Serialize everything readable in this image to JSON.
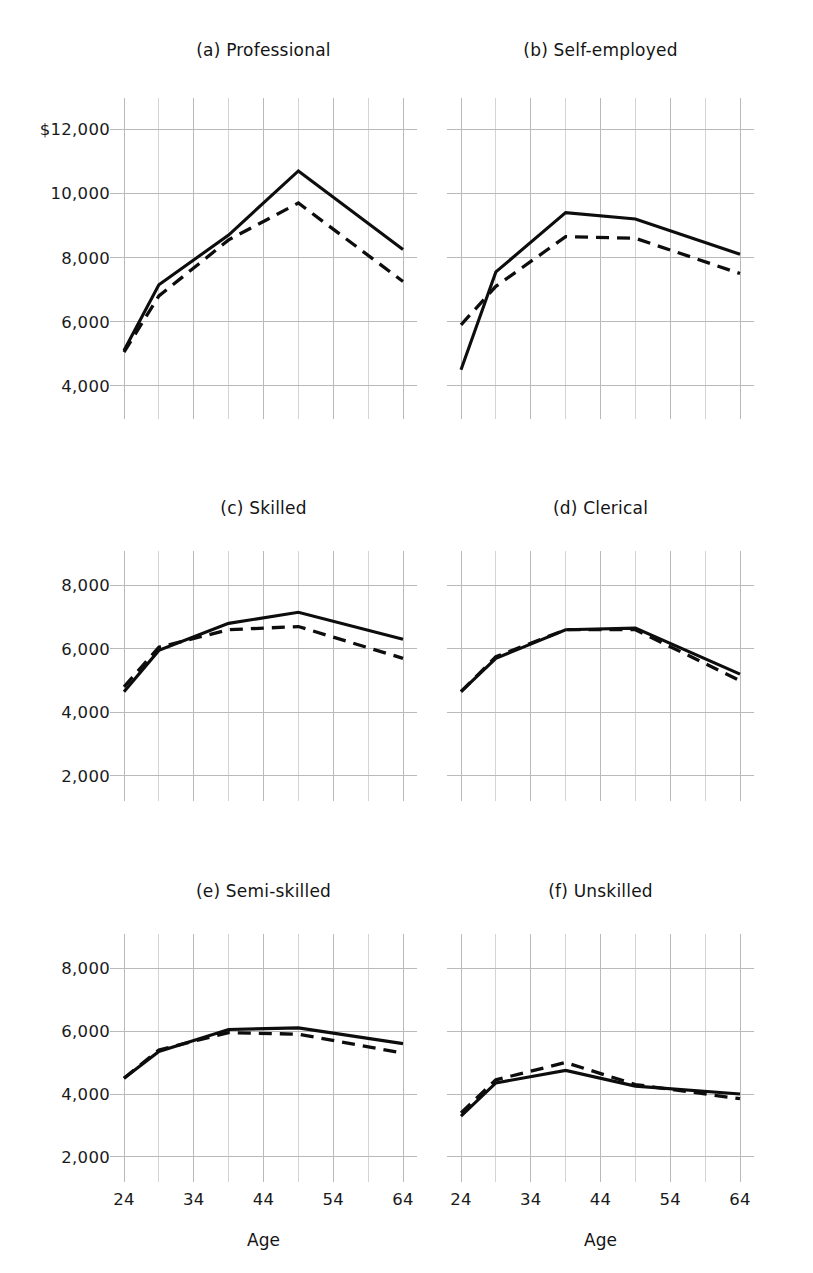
{
  "chart_data": {
    "type": "line",
    "title": "",
    "xlabel": "Age",
    "ylabel": "",
    "grid": true,
    "legend": "none",
    "x": [
      24,
      29,
      39,
      49,
      64
    ],
    "xlim": [
      24,
      64
    ],
    "x_ticklabels": [
      "24",
      "34",
      "44",
      "54",
      "64"
    ],
    "x_tickvalues": [
      24,
      34,
      44,
      54,
      64
    ],
    "x_gridlines": [
      24,
      29,
      34,
      39,
      44,
      49,
      54,
      59,
      64
    ],
    "series_names": [
      "solid",
      "dashed"
    ],
    "panels": [
      {
        "key": "a",
        "label": "(a)",
        "name": "Professional",
        "title": "(a)  Professional",
        "ylim": [
          3400,
          12600
        ],
        "y_ticklabels": [
          "$12,000",
          "10,000",
          "8,000",
          "6,000",
          "4,000"
        ],
        "y_tickvalues": [
          12000,
          10000,
          8000,
          6000,
          4000
        ],
        "series": [
          {
            "name": "solid",
            "values": [
              5100,
              7150,
              8700,
              10700,
              8250
            ]
          },
          {
            "name": "dashed",
            "values": [
              5050,
              6800,
              8550,
              9700,
              7250
            ]
          }
        ]
      },
      {
        "key": "b",
        "label": "(b)",
        "name": "Self-employed",
        "title": "(b)  Self-employed",
        "ylim": [
          3400,
          12600
        ],
        "y_ticklabels": [
          "$12,000",
          "10,000",
          "8,000",
          "6,000",
          "4,000"
        ],
        "y_tickvalues": [
          12000,
          10000,
          8000,
          6000,
          4000
        ],
        "series": [
          {
            "name": "solid",
            "values": [
              4500,
              7550,
              9400,
              9200,
              8100
            ]
          },
          {
            "name": "dashed",
            "values": [
              5900,
              7100,
              8650,
              8600,
              7500
            ]
          }
        ]
      },
      {
        "key": "c",
        "label": "(c)",
        "name": "Skilled",
        "title": "(c)  Skilled",
        "ylim": [
          1650,
          8700
        ],
        "y_ticklabels": [
          "8,000",
          "6,000",
          "4,000",
          "2,000"
        ],
        "y_tickvalues": [
          8000,
          6000,
          4000,
          2000
        ],
        "series": [
          {
            "name": "solid",
            "values": [
              4650,
              5950,
              6800,
              7150,
              6300
            ]
          },
          {
            "name": "dashed",
            "values": [
              4800,
              6050,
              6600,
              6700,
              5700
            ]
          }
        ]
      },
      {
        "key": "d",
        "label": "(d)",
        "name": "Clerical",
        "title": "(d)  Clerical",
        "ylim": [
          1650,
          8700
        ],
        "y_ticklabels": [
          "8,000",
          "6,000",
          "4,000",
          "2,000"
        ],
        "y_tickvalues": [
          8000,
          6000,
          4000,
          2000
        ],
        "series": [
          {
            "name": "solid",
            "values": [
              4650,
              5700,
              6600,
              6650,
              5200
            ]
          },
          {
            "name": "dashed",
            "values": [
              4650,
              5750,
              6600,
              6600,
              5000
            ]
          }
        ]
      },
      {
        "key": "e",
        "label": "(e)",
        "name": "Semi-skilled",
        "title": "(e)  Semi-skilled",
        "ylim": [
          1650,
          8700
        ],
        "y_ticklabels": [
          "8,000",
          "6,000",
          "4,000",
          "2,000"
        ],
        "y_tickvalues": [
          8000,
          6000,
          4000,
          2000
        ],
        "series": [
          {
            "name": "solid",
            "values": [
              4500,
              5350,
              6050,
              6100,
              5600
            ]
          },
          {
            "name": "dashed",
            "values": [
              4500,
              5400,
              5950,
              5900,
              5300
            ]
          }
        ]
      },
      {
        "key": "f",
        "label": "(f)",
        "name": "Unskilled",
        "title": "(f)  Unskilled",
        "ylim": [
          1650,
          8700
        ],
        "y_ticklabels": [
          "8,000",
          "6,000",
          "4,000",
          "2,000"
        ],
        "y_tickvalues": [
          8000,
          6000,
          4000,
          2000
        ],
        "series": [
          {
            "name": "solid",
            "values": [
              3300,
              4350,
              4750,
              4250,
              4000
            ]
          },
          {
            "name": "dashed",
            "values": [
              3400,
              4450,
              5000,
              4300,
              3850
            ]
          }
        ]
      }
    ]
  },
  "axis": {
    "x_title_left": "Age",
    "x_title_right": "Age"
  }
}
